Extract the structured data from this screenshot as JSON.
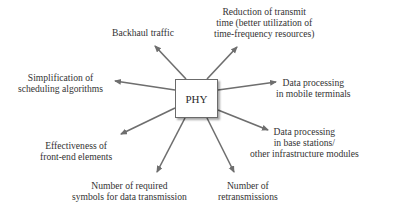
{
  "diagram": {
    "type": "hub-and-spoke",
    "center": {
      "label": "PHY"
    },
    "colors": {
      "arrow": "#6e6e6e",
      "text": "#333333",
      "box_border": "#6b6b6b"
    },
    "nodes": [
      {
        "id": "backhaul",
        "lines": [
          "Backhaul traffic"
        ]
      },
      {
        "id": "transmit-time",
        "lines": [
          "Reduction of transmit",
          "time (better utilization of",
          "time-frequency resources)"
        ]
      },
      {
        "id": "scheduling",
        "lines": [
          "Simplification of",
          "scheduling algorithms"
        ]
      },
      {
        "id": "mobile-terminals",
        "lines": [
          "Data processing",
          "in mobile terminals"
        ]
      },
      {
        "id": "front-end",
        "lines": [
          "Effectiveness of",
          "front-end elements"
        ]
      },
      {
        "id": "base-stations",
        "lines": [
          "Data processing",
          "in base stations/",
          "other infrastructure modules"
        ]
      },
      {
        "id": "symbols",
        "lines": [
          "Number of required",
          "symbols for data transmission"
        ]
      },
      {
        "id": "retransmissions",
        "lines": [
          "Number of",
          "retransmissions"
        ]
      }
    ]
  }
}
